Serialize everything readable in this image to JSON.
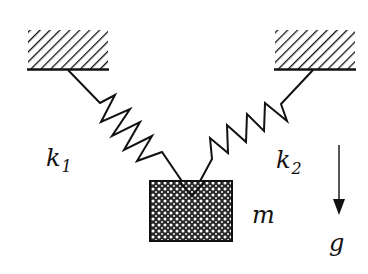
{
  "diagram": {
    "labels": {
      "spring_left": "k",
      "spring_left_sub": "1",
      "spring_right": "k",
      "spring_right_sub": "2",
      "mass": "m",
      "gravity": "g"
    },
    "elements": {
      "left_support": {
        "x": 28,
        "y": 30,
        "w": 80,
        "h": 39
      },
      "right_support": {
        "x": 275,
        "y": 30,
        "w": 80,
        "h": 39
      },
      "mass_block": {
        "x": 150,
        "y": 181,
        "w": 82,
        "h": 60
      },
      "gravity_arrow": {
        "x": 339,
        "y1": 145,
        "y2": 213
      }
    },
    "colors": {
      "stroke": "#111111",
      "background": "#ffffff"
    }
  }
}
